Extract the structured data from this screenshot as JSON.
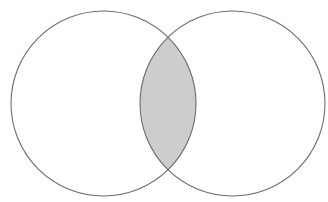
{
  "diagram": {
    "type": "venn",
    "sets": [
      {
        "name": "set-a",
        "cx": 103.5,
        "cy": 103.5,
        "r": 92.5
      },
      {
        "name": "set-b",
        "cx": 232.5,
        "cy": 103.5,
        "r": 92.5
      }
    ],
    "highlighted_region": "intersection",
    "colors": {
      "background": "#ffffff",
      "stroke": "#6b6b6b",
      "intersection_fill": "#cdcdcd",
      "set_fill": "#ffffff"
    }
  }
}
